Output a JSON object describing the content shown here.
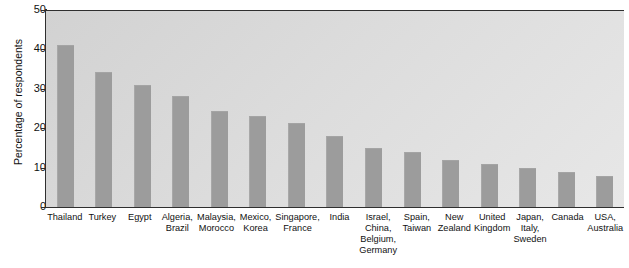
{
  "chart_data": {
    "type": "bar",
    "title": "",
    "xlabel": "",
    "ylabel": "Percentage of respondents",
    "ylim": [
      0,
      50
    ],
    "yticks": [
      0,
      10,
      20,
      30,
      40,
      50
    ],
    "grid": false,
    "legend": "none",
    "categories": [
      "Thailand",
      "Turkey",
      "Egypt",
      "Algeria,\nBrazil",
      "Malaysia,\nMorocco",
      "Mexico,\nKorea",
      "Singapore,\nFrance",
      "India",
      "Israel,\nChina,\nBelgium,\nGermany",
      "Spain,\nTaiwan",
      "New\nZealand",
      "United\nKingdom",
      "Japan,\nItaly,\nSweden",
      "Canada",
      "USA,\nAustralia"
    ],
    "values": [
      41,
      34.3,
      31,
      28.3,
      24.3,
      23,
      21.2,
      18,
      15,
      14,
      12,
      11,
      10,
      8.8,
      7.8
    ],
    "bar_color": "#9c9c9c",
    "plot_background": "#dcdcdc",
    "axis_color": "#2f2f2f"
  }
}
